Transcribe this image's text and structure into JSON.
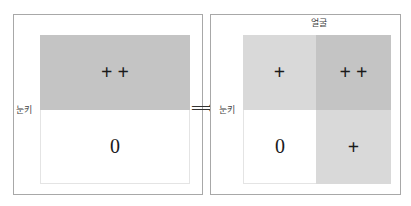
{
  "left_panel": {
    "row_label": "눈키",
    "cells": [
      {
        "symbol": "+ +",
        "fill": "#c4c4c4"
      },
      {
        "symbol": "0",
        "fill": "#ffffff"
      }
    ]
  },
  "arrow": "⟹",
  "right_panel": {
    "row_label": "눈키",
    "column_label": "얼굴",
    "cells": [
      {
        "symbol": "+",
        "fill": "#d9d9d9"
      },
      {
        "symbol": "+ +",
        "fill": "#c4c4c4"
      },
      {
        "symbol": "0",
        "fill": "#ffffff"
      },
      {
        "symbol": "+",
        "fill": "#d9d9d9"
      }
    ]
  }
}
